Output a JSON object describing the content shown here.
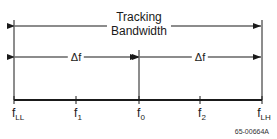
{
  "diagram": {
    "title_line1": "Tracking",
    "title_line2": "Bandwidth",
    "delta_left": "Δf",
    "delta_right": "Δf",
    "axis_labels": [
      {
        "base": "f",
        "sub": "LL"
      },
      {
        "base": "f",
        "sub": "1"
      },
      {
        "base": "f",
        "sub": "0"
      },
      {
        "base": "f",
        "sub": "2"
      },
      {
        "base": "f",
        "sub": "LH"
      }
    ],
    "figure_code": "65-00664A",
    "line_color": "#1a1a1a"
  }
}
